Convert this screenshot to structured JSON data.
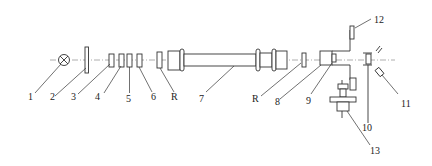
{
  "diagram": {
    "type": "optical-bench-schematic",
    "colors": {
      "line": "#333333",
      "axis": "#9a9a9a",
      "background": "#ffffff"
    },
    "labels": [
      {
        "id": "1",
        "text": "1",
        "component": "light-source (lamp ⊗)"
      },
      {
        "id": "2",
        "text": "2",
        "component": "plate / diaphragm"
      },
      {
        "id": "3",
        "text": "3",
        "component": "optical element"
      },
      {
        "id": "4",
        "text": "4",
        "component": "optical element"
      },
      {
        "id": "5",
        "text": "5",
        "component": "optical element"
      },
      {
        "id": "6",
        "text": "6",
        "component": "optical element"
      },
      {
        "id": "R1",
        "text": "R",
        "component": "window / reflector (left)"
      },
      {
        "id": "7",
        "text": "7",
        "component": "tube / cell"
      },
      {
        "id": "R2",
        "text": "R",
        "component": "window / reflector (right)"
      },
      {
        "id": "8",
        "text": "8",
        "component": "housing"
      },
      {
        "id": "9",
        "text": "9",
        "component": "inner element"
      },
      {
        "id": "10",
        "text": "10",
        "component": "holder"
      },
      {
        "id": "11",
        "text": "11",
        "component": "detector"
      },
      {
        "id": "12",
        "text": "12",
        "component": "upper bracket"
      },
      {
        "id": "13",
        "text": "13",
        "component": "mount / base"
      }
    ]
  }
}
